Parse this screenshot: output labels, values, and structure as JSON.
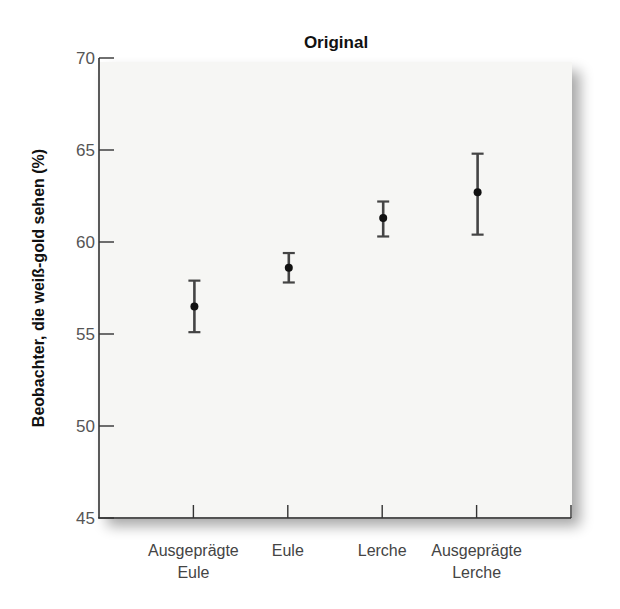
{
  "chart_data": {
    "type": "scatter",
    "subtype": "point-with-error-bars",
    "title": "Original",
    "xlabel": "",
    "ylabel": "Beobachter, die weiß-gold sehen (%)",
    "ylim": [
      45,
      70
    ],
    "yticks": [
      45,
      50,
      55,
      60,
      65,
      70
    ],
    "grid": false,
    "legend": null,
    "categories": [
      [
        "Ausgeprägte",
        "Eule"
      ],
      [
        "Eule"
      ],
      [
        "Lerche"
      ],
      [
        "Ausgeprägte",
        "Lerche"
      ]
    ],
    "category_labels": [
      "Ausgeprägte Eule",
      "Eule",
      "Lerche",
      "Ausgeprägte Lerche"
    ],
    "values": [
      56.5,
      58.6,
      61.3,
      62.7
    ],
    "error_upper": [
      57.9,
      59.4,
      62.2,
      64.8
    ],
    "error_lower": [
      55.1,
      57.8,
      60.3,
      60.4
    ],
    "colors": {
      "axis": "#333333",
      "marker": "#111111",
      "errorbar": "#444444",
      "panel": "#f6f6f4"
    }
  }
}
